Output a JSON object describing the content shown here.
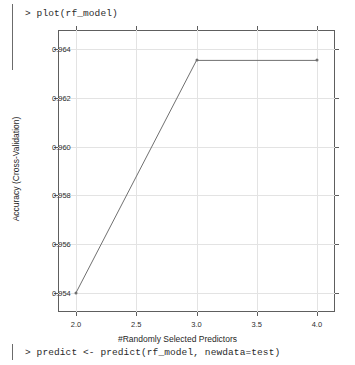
{
  "console": {
    "prompt_symbol": ">",
    "command_plot": "> plot(rf_model)",
    "command_predict": "> predict <- predict(rf_model, newdata=test)"
  },
  "chart_data": {
    "type": "line",
    "title": "",
    "xlabel": "#Randomly Selected Predictors",
    "ylabel": "Accuracy (Cross-Validation)",
    "x": [
      2.0,
      3.0,
      4.0
    ],
    "values": [
      0.954,
      0.96355,
      0.96355
    ],
    "xlim": [
      1.85,
      4.15
    ],
    "ylim": [
      0.9532,
      0.9648
    ],
    "xticks": [
      2.0,
      2.5,
      3.0,
      3.5,
      4.0
    ],
    "xticklabels": [
      "2.0",
      "2.5",
      "3.0",
      "3.5",
      "4.0"
    ],
    "yticks": [
      0.954,
      0.956,
      0.958,
      0.96,
      0.962,
      0.964
    ],
    "yticklabels": [
      "0.954",
      "0.956",
      "0.958",
      "0.960",
      "0.962",
      "0.964"
    ],
    "grid": true,
    "legend": "none",
    "line_color": "#707070",
    "marker": "circle",
    "frame_color": "#5e5e5e",
    "grid_color": "#e3e3e3"
  }
}
